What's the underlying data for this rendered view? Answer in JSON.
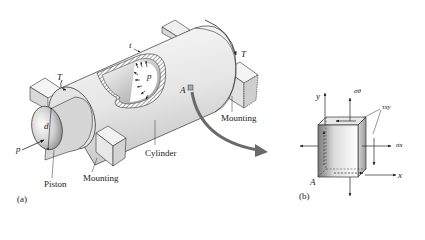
{
  "figure": {
    "panel_a": {
      "tag": "(a)",
      "labels": {
        "torque_left": "T",
        "torque_right": "T",
        "wall_thickness": "t",
        "internal_pressure": "p",
        "pressure_on_piston": "p",
        "diameter": "d",
        "point": "A",
        "cylinder": "Cylinder",
        "piston": "Piston",
        "mounting_front": "Mounting",
        "mounting_back": "Mounting"
      }
    },
    "panel_b": {
      "tag": "(b)",
      "labels": {
        "y_axis": "y",
        "x_axis": "x",
        "hoop_stress": "σθ",
        "axial_stress": "σx",
        "shear_stress": "τxy",
        "point": "A"
      }
    },
    "colors": {
      "line": "#222222",
      "shade_light": "#f2f2f2",
      "shade_mid": "#cfcfcf",
      "shade_dark": "#8c8c8c",
      "arrow_gray": "#6a6a6a"
    }
  }
}
